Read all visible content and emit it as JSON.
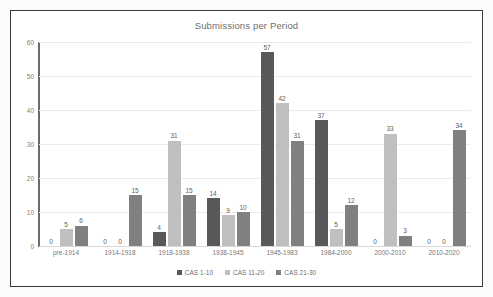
{
  "chart_data": {
    "type": "bar",
    "title": "Submissions per Period",
    "xlabel": "",
    "ylabel": "",
    "ylim": [
      0,
      60
    ],
    "yticks": [
      0,
      10,
      20,
      30,
      40,
      50,
      60
    ],
    "grid": true,
    "legend_position": "bottom",
    "categories": [
      "pre-1914",
      "1914-1918",
      "1918-1938",
      "1938-1945",
      "1945-1983",
      "1984-2000",
      "2000-2010",
      "2010-2020"
    ],
    "series": [
      {
        "name": "CAS 1-10",
        "color": "#595959",
        "values": [
          0,
          0,
          4,
          14,
          57,
          37,
          0,
          0
        ]
      },
      {
        "name": "CAS 11-20",
        "color": "#bfbfbf",
        "values": [
          5,
          0,
          31,
          9,
          42,
          5,
          33,
          0
        ]
      },
      {
        "name": "CAS 21-30",
        "color": "#808080",
        "values": [
          6,
          15,
          15,
          10,
          31,
          12,
          3,
          34
        ]
      }
    ]
  },
  "colors": {
    "card_border": "#3a3a3a",
    "axis": "#6b6b6b",
    "gridline": "#eceaea",
    "title_text": "#6e6e6e",
    "tick_text": "#808080"
  }
}
